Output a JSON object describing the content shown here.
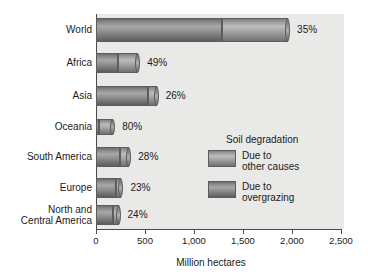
{
  "chart_data": {
    "type": "bar",
    "orientation": "horizontal",
    "stacked": true,
    "title": "",
    "xlabel": "Million hectares",
    "ylabel": "",
    "xlim": [
      0,
      2500
    ],
    "xticks": [
      0,
      500,
      1000,
      1500,
      2000,
      2500
    ],
    "xticklabels": [
      "0",
      "500",
      "1,000",
      "1,500",
      "2,000",
      "2,500"
    ],
    "grid": false,
    "legend": {
      "title": "Soil degradation",
      "position": "inside-right",
      "entries": [
        {
          "name": "Due to\nother causes",
          "color": "#a8a8a8"
        },
        {
          "name": "Due to\novergrazing",
          "color": "#7d7d7d"
        }
      ]
    },
    "categories": [
      "World",
      "Africa",
      "Asia",
      "Oceania",
      "South America",
      "Europe",
      "North and\nCentral America"
    ],
    "series": [
      {
        "name": "Due to overgrazing",
        "values": [
          1285,
          220,
          530,
          35,
          245,
          200,
          175
        ]
      },
      {
        "name": "Due to other causes",
        "values": [
          675,
          210,
          90,
          140,
          95,
          60,
          55
        ]
      }
    ],
    "totals": [
      1960,
      430,
      620,
      175,
      340,
      260,
      230
    ],
    "data_labels": [
      "35%",
      "49%",
      "26%",
      "80%",
      "28%",
      "23%",
      "24%"
    ],
    "data_label_meaning": "share due to other causes"
  },
  "axis": {
    "x_title": "Million hectares",
    "ticks": [
      "0",
      "500",
      "1,000",
      "1,500",
      "2,000",
      "2,500"
    ]
  },
  "legend": {
    "title": "Soil degradation",
    "item_other_causes": "Due to\nother causes",
    "item_overgrazing": "Due to\novergrazing"
  },
  "rows": [
    {
      "label": "World",
      "pct": "35%"
    },
    {
      "label": "Africa",
      "pct": "49%"
    },
    {
      "label": "Asia",
      "pct": "26%"
    },
    {
      "label": "Oceania",
      "pct": "80%"
    },
    {
      "label": "South America",
      "pct": "28%"
    },
    {
      "label": "Europe",
      "pct": "23%"
    },
    {
      "label": "North and\nCentral America",
      "pct": "24%"
    }
  ]
}
